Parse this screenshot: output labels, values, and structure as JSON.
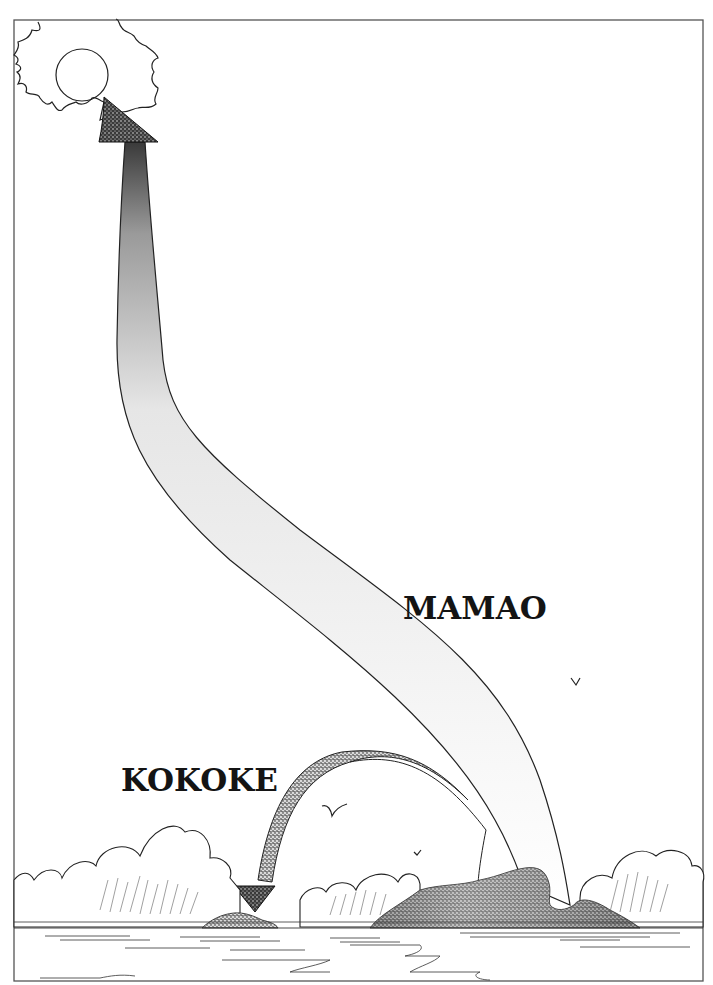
{
  "figure": {
    "type": "illustration"
  },
  "labels": {
    "upward_flow": "MAMAO",
    "downward_flow": "KOKOKE"
  },
  "elements": {
    "sun": "sun",
    "large_island": "large island",
    "small_island": "small islet",
    "birds": 3,
    "clouds": "cumulus clouds on horizon",
    "sea": "water with reflections"
  },
  "colors": {
    "ink": "#1a1a1a",
    "paper": "#ffffff",
    "frame": "#555555"
  }
}
